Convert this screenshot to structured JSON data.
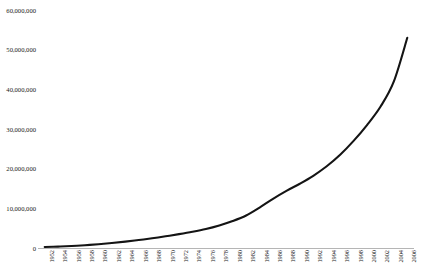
{
  "chart_data": {
    "type": "line",
    "title": "",
    "xlabel": "",
    "ylabel": "",
    "ylim": [
      0,
      60000000
    ],
    "xlim": [
      1952,
      2006
    ],
    "grid": false,
    "legend": false,
    "legend_position": "none",
    "line_color": "#141414",
    "background_color": "#ffffff",
    "axis_color": "#b5b5b5",
    "y_ticks": [
      "60,000,000",
      "50,000,000",
      "40,000,000",
      "30,000,000",
      "20,000,000",
      "10,000,000",
      "0"
    ],
    "y_tick_values": [
      60000000,
      50000000,
      40000000,
      30000000,
      20000000,
      10000000,
      0
    ],
    "categories": [
      "1952",
      "1954",
      "1956",
      "1958",
      "1960",
      "1962",
      "1964",
      "1966",
      "1968",
      "1970",
      "1972",
      "1974",
      "1976",
      "1978",
      "1980",
      "1982",
      "1984",
      "1986",
      "1988",
      "1990",
      "1992",
      "1994",
      "1996",
      "1998",
      "2000",
      "2002",
      "2004",
      "2006"
    ],
    "x": [
      1952,
      1954,
      1956,
      1958,
      1960,
      1962,
      1964,
      1966,
      1968,
      1970,
      1972,
      1974,
      1976,
      1978,
      1980,
      1982,
      1984,
      1986,
      1988,
      1990,
      1992,
      1994,
      1996,
      1998,
      2000,
      2002,
      2004,
      2006
    ],
    "values": [
      250000,
      350000,
      500000,
      700000,
      950000,
      1250000,
      1600000,
      2000000,
      2450000,
      2950000,
      3500000,
      4100000,
      4800000,
      5700000,
      6800000,
      8200000,
      10200000,
      12400000,
      14400000,
      16200000,
      18200000,
      20600000,
      23500000,
      27000000,
      31000000,
      35600000,
      42000000,
      53000000
    ],
    "series": [
      {
        "name": "series-1",
        "values": [
          250000,
          350000,
          500000,
          700000,
          950000,
          1250000,
          1600000,
          2000000,
          2450000,
          2950000,
          3500000,
          4100000,
          4800000,
          5700000,
          6800000,
          8200000,
          10200000,
          12400000,
          14400000,
          16200000,
          18200000,
          20600000,
          23500000,
          27000000,
          31000000,
          35600000,
          42000000,
          53000000
        ]
      }
    ]
  }
}
